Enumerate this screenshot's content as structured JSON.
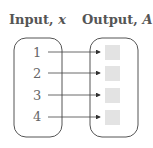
{
  "diagram": {
    "type": "mapping",
    "input_header": {
      "label": "Input, ",
      "var": "x"
    },
    "output_header": {
      "label": "Output, ",
      "var": "A"
    },
    "inputs": [
      "1",
      "2",
      "3",
      "4"
    ],
    "outputs": [
      "",
      "",
      "",
      ""
    ],
    "colors": {
      "stroke": "#555555",
      "text": "#666666",
      "placeholder": "#e3e3e3"
    }
  }
}
